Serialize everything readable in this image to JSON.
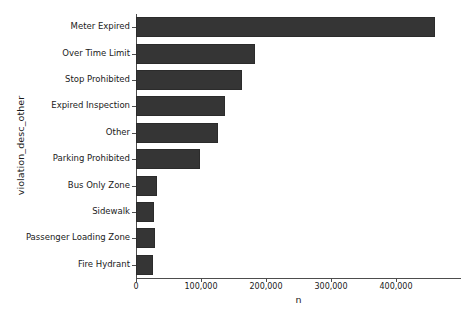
{
  "chart_data": {
    "type": "bar",
    "orientation": "horizontal",
    "title": "",
    "xlabel": "n",
    "ylabel": "violation_desc_other",
    "categories": [
      "Meter Expired",
      "Over Time Limit",
      "Stop Prohibited",
      "Expired Inspection",
      "Other",
      "Parking Prohibited",
      "Bus Only Zone",
      "Sidewalk",
      "Passenger Loading Zone",
      "Fire Hydrant"
    ],
    "values": [
      460000,
      183000,
      163000,
      137000,
      126000,
      98000,
      32000,
      28000,
      29000,
      26000
    ],
    "xlim": [
      0,
      500000
    ],
    "xticks": [
      0,
      100000,
      200000,
      300000,
      400000
    ],
    "xtick_labels": [
      "0",
      "100,000",
      "200,000",
      "300,000",
      "400,000"
    ],
    "grid": false,
    "legend": false,
    "bar_color": "#353535",
    "background_color": "#ffffff",
    "axis_color": "#4d4d4d"
  }
}
